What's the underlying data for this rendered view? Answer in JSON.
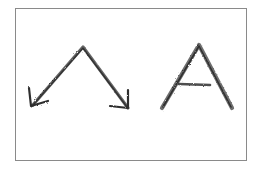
{
  "figure": {
    "stroke_color": "#3a3a3a",
    "frame_color": "#8a8a8a",
    "background": "#ffffff",
    "elements": [
      {
        "name": "double-arrow-caret",
        "label": "caret arrow",
        "apex": [
          83,
          47
        ],
        "left_end": [
          32,
          106
        ],
        "right_end": [
          128,
          108
        ],
        "left_arrowhead_barbs": [
          [
            29,
            88
          ],
          [
            48,
            101
          ]
        ],
        "right_arrowhead_barbs": [
          [
            128,
            90
          ],
          [
            110,
            106
          ]
        ]
      },
      {
        "name": "letter-a",
        "label": "A",
        "apex": [
          199,
          45
        ],
        "left_foot": [
          162,
          108
        ],
        "right_foot": [
          232,
          108
        ],
        "crossbar": [
          [
            179,
            84
          ],
          [
            210,
            85
          ]
        ]
      }
    ]
  }
}
